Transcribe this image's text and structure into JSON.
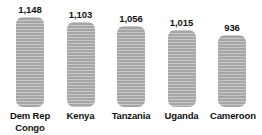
{
  "chart_data": {
    "type": "bar",
    "title": "",
    "xlabel": "",
    "ylabel": "",
    "categories": [
      "Dem Rep Congo",
      "Kenya",
      "Tanzania",
      "Uganda",
      "Cameroon"
    ],
    "values": [
      1148,
      1103,
      1056,
      1015,
      936
    ],
    "value_labels": [
      "1,148",
      "1,103",
      "1,056",
      "1,015",
      "936"
    ],
    "ylim": [
      0,
      1148
    ],
    "grid": false,
    "legend": null,
    "bars": [
      {
        "category": "Dem Rep Congo",
        "category_line1": "Dem Rep",
        "category_line2": "Congo",
        "value": 1148,
        "value_label": "1,148",
        "height_px": 90
      },
      {
        "category": "Kenya",
        "category_line1": "Kenya",
        "category_line2": "",
        "value": 1103,
        "value_label": "1,103",
        "height_px": 85
      },
      {
        "category": "Tanzania",
        "category_line1": "Tanzania",
        "category_line2": "",
        "value": 1056,
        "value_label": "1,056",
        "height_px": 81
      },
      {
        "category": "Uganda",
        "category_line1": "Uganda",
        "category_line2": "",
        "value": 1015,
        "value_label": "1,015",
        "height_px": 77
      },
      {
        "category": "Cameroon",
        "category_line1": "Cameroon",
        "category_line2": "",
        "value": 936,
        "value_label": "936",
        "height_px": 72
      }
    ],
    "colors": {
      "bar_fill": "#a6a6a6",
      "text": "#111111",
      "background": "#ffffff"
    }
  }
}
